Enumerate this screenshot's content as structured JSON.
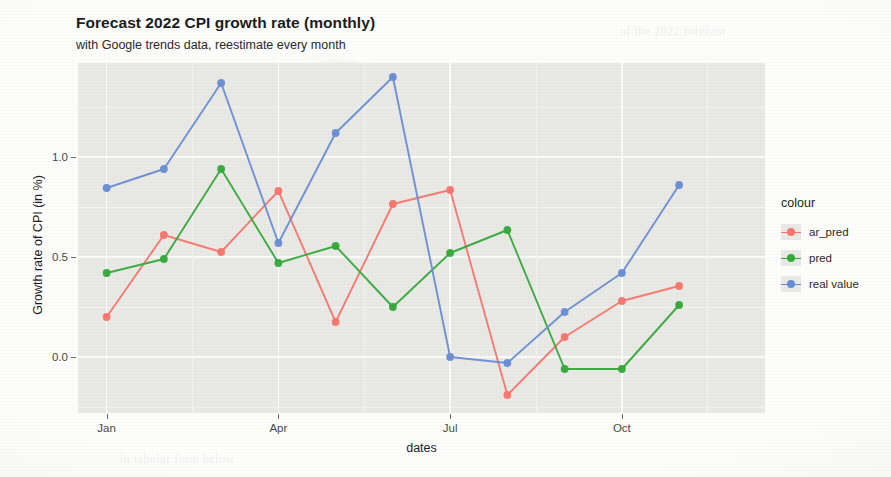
{
  "title": "Forecast 2022 CPI growth rate (monthly)",
  "subtitle": "with Google trends data, reestimate every month",
  "legend": {
    "title": "colour",
    "items": [
      {
        "label": "ar_pred",
        "color": "#F8766D"
      },
      {
        "label": "pred",
        "color": "#36A93C"
      },
      {
        "label": "real value",
        "color": "#6A8ED4"
      }
    ]
  },
  "axes": {
    "xlabel": "dates",
    "ylabel": "Growth rate of CPI (in %)",
    "yticks": [
      "0.0",
      "0.5",
      "1.0"
    ],
    "ytick_values": [
      0.0,
      0.5,
      1.0
    ],
    "xticks": [
      "Jan",
      "Apr",
      "Jul",
      "Oct"
    ],
    "xtick_indices": [
      0,
      3,
      6,
      9
    ]
  },
  "chart_data": {
    "type": "line",
    "title": "Forecast 2022 CPI growth rate (monthly)",
    "subtitle": "with Google trends data, reestimate every month",
    "xlabel": "dates",
    "ylabel": "Growth rate of CPI (in %)",
    "categories": [
      "Jan",
      "Feb",
      "Mar",
      "Apr",
      "May",
      "Jun",
      "Jul",
      "Aug",
      "Sep",
      "Oct",
      "Nov",
      "Dec"
    ],
    "xticks_shown": [
      "Jan",
      "Apr",
      "Jul",
      "Oct"
    ],
    "xlim": [
      -0.5,
      11.5
    ],
    "ylim": [
      -0.28,
      1.47
    ],
    "grid": true,
    "legend_position": "right",
    "legend_title": "colour",
    "series": [
      {
        "name": "ar_pred",
        "color": "#F8766D",
        "values": [
          0.2,
          0.61,
          0.525,
          0.83,
          0.175,
          0.765,
          0.835,
          -0.19,
          0.1,
          0.28,
          0.355,
          null
        ]
      },
      {
        "name": "pred",
        "color": "#36A93C",
        "values": [
          0.42,
          0.49,
          0.94,
          0.47,
          0.555,
          0.25,
          0.52,
          0.635,
          -0.06,
          -0.06,
          0.26,
          null
        ]
      },
      {
        "name": "real value",
        "color": "#6A8ED4",
        "values": [
          0.845,
          0.94,
          1.37,
          0.57,
          1.12,
          1.4,
          0.0,
          -0.03,
          0.225,
          0.42,
          0.86,
          null
        ]
      }
    ]
  },
  "ghost_text": {
    "line1": "Plinoriali(R)(X)(A)(S)",
    "line2": "of the 2022 forecast",
    "line3": "in tabular form below"
  }
}
